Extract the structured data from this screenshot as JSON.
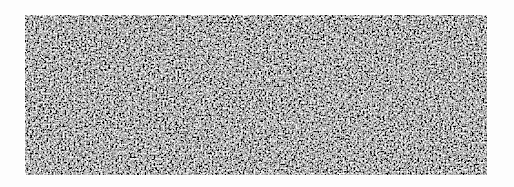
{
  "image": {
    "description": "Grayscale fibrous network texture on white background",
    "colors": {
      "background": "#fdfdfd",
      "dark": "#1a1a1a",
      "light": "#e8e8e8"
    }
  }
}
